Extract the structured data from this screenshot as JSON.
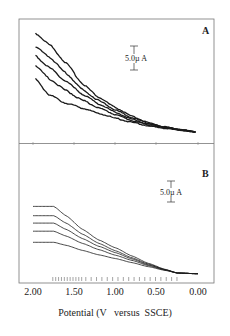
{
  "chart_data": [
    {
      "panel": "A",
      "type": "line",
      "title": "A",
      "xlabel": "Potential (V   versus  SSCE)",
      "ylabel": "",
      "x_ticks": [
        "2.00",
        "1.50",
        "1.00",
        "0.50",
        "0.00"
      ],
      "xlim": [
        2.0,
        0.0
      ],
      "scale_bar": "5.0µ A",
      "grid": false,
      "style": "experimental (noisy)",
      "x": [
        1.97,
        1.8,
        1.6,
        1.4,
        1.2,
        1.0,
        0.8,
        0.6,
        0.4,
        0.2,
        0.03
      ],
      "series": [
        {
          "name": "curve 1",
          "values": [
            21.5,
            19.0,
            15.0,
            10.5,
            7.5,
            5.3,
            3.4,
            2.0,
            1.1,
            0.5,
            0.0
          ]
        },
        {
          "name": "curve 2",
          "values": [
            18.5,
            16.3,
            12.8,
            9.2,
            6.8,
            4.8,
            3.1,
            1.9,
            1.0,
            0.5,
            0.0
          ]
        },
        {
          "name": "curve 3",
          "values": [
            16.5,
            14.0,
            11.0,
            8.2,
            6.1,
            4.3,
            2.8,
            1.7,
            1.0,
            0.4,
            0.0
          ]
        },
        {
          "name": "curve 4",
          "values": [
            14.5,
            11.5,
            9.0,
            6.9,
            5.2,
            3.8,
            2.5,
            1.5,
            0.9,
            0.4,
            0.0
          ]
        },
        {
          "name": "curve 5",
          "values": [
            11.5,
            8.0,
            6.3,
            5.2,
            4.0,
            3.0,
            2.1,
            1.3,
            0.8,
            0.4,
            0.0
          ]
        }
      ]
    },
    {
      "panel": "B",
      "type": "line",
      "title": "B",
      "xlabel": "Potential (V   versus  SSCE)",
      "ylabel": "",
      "x_ticks": [
        "2.00",
        "1.50",
        "1.00",
        "0.50",
        "0.00"
      ],
      "xlim": [
        2.0,
        0.0
      ],
      "scale_bar": "5.0µ A",
      "grid": false,
      "style": "simulated (smooth)",
      "x": [
        2.0,
        1.75,
        1.6,
        1.4,
        1.2,
        1.0,
        0.8,
        0.6,
        0.4,
        0.25,
        0.0
      ],
      "series": [
        {
          "name": "curve 1",
          "values": [
            18.0,
            18.0,
            15.5,
            11.8,
            8.9,
            6.8,
            4.6,
            2.6,
            1.0,
            0.0,
            -0.2
          ]
        },
        {
          "name": "curve 2",
          "values": [
            15.5,
            15.5,
            13.5,
            10.5,
            8.0,
            6.0,
            4.1,
            2.4,
            0.9,
            0.0,
            -0.2
          ]
        },
        {
          "name": "curve 3",
          "values": [
            13.5,
            13.5,
            11.8,
            9.3,
            7.2,
            5.5,
            3.8,
            2.2,
            0.9,
            0.0,
            -0.2
          ]
        },
        {
          "name": "curve 4",
          "values": [
            11.3,
            11.3,
            10.0,
            8.0,
            6.3,
            4.8,
            3.4,
            2.0,
            0.8,
            0.0,
            -0.2
          ]
        },
        {
          "name": "curve 5",
          "values": [
            8.3,
            8.3,
            7.5,
            6.1,
            4.9,
            3.9,
            2.8,
            1.7,
            0.7,
            0.0,
            -0.2
          ]
        }
      ],
      "potential_markers": "two rows of small vertical tick marks between ~1.75 V and ~0.25 V"
    }
  ],
  "panels": {
    "a": {
      "label": "A",
      "scale": "5.0µ A"
    },
    "b": {
      "label": "B",
      "scale": "5.0µ A"
    }
  },
  "axis": {
    "ticks": [
      "2.00",
      "1.50",
      "1.00",
      "0.50",
      "0.00"
    ],
    "label": "Potential (V   versus  SSCE)"
  }
}
